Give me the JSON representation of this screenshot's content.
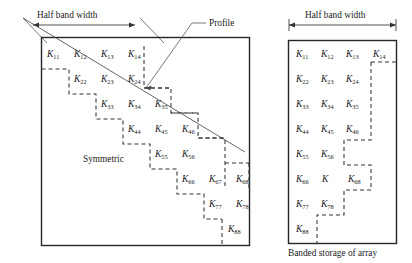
{
  "figure": {
    "title_caption": "Banded storage of array",
    "annotations": {
      "half_band_width_left": "Half band width",
      "half_band_width_right": "Half band width",
      "profile": "Profile",
      "symmetric": "Symmetric"
    }
  },
  "full_matrix": {
    "name": "full-symmetric-matrix",
    "rows": [
      {
        "row_index": 1,
        "cells": [
          {
            "base": "K",
            "sub": "11"
          },
          {
            "base": "K",
            "sub": "12"
          },
          {
            "base": "K",
            "sub": "13"
          },
          {
            "base": "K",
            "sub": "14"
          }
        ]
      },
      {
        "row_index": 2,
        "cells": [
          {
            "base": "K",
            "sub": "22"
          },
          {
            "base": "K",
            "sub": "23"
          },
          {
            "base": "K",
            "sub": "24"
          }
        ]
      },
      {
        "row_index": 3,
        "cells": [
          {
            "base": "K",
            "sub": "33"
          },
          {
            "base": "K",
            "sub": "34"
          },
          {
            "base": "K",
            "sub": "35"
          }
        ]
      },
      {
        "row_index": 4,
        "cells": [
          {
            "base": "K",
            "sub": "44"
          },
          {
            "base": "K",
            "sub": "45"
          },
          {
            "base": "K",
            "sub": "46"
          }
        ]
      },
      {
        "row_index": 5,
        "cells": [
          {
            "base": "K",
            "sub": "55"
          },
          {
            "base": "K",
            "sub": "56"
          }
        ]
      },
      {
        "row_index": 6,
        "cells": [
          {
            "base": "K",
            "sub": "66"
          },
          {
            "base": "K",
            "sub": "67"
          },
          {
            "base": "K",
            "sub": "68"
          }
        ]
      },
      {
        "row_index": 7,
        "cells": [
          {
            "base": "K",
            "sub": "77"
          },
          {
            "base": "K",
            "sub": "78"
          }
        ]
      },
      {
        "row_index": 8,
        "cells": [
          {
            "base": "K",
            "sub": "88"
          }
        ]
      }
    ]
  },
  "banded_matrix": {
    "name": "banded-storage-matrix",
    "caption": "Banded storage of array",
    "rows": [
      {
        "row_index": 1,
        "cells": [
          {
            "base": "K",
            "sub": "11"
          },
          {
            "base": "K",
            "sub": "12"
          },
          {
            "base": "K",
            "sub": "13"
          },
          {
            "base": "K",
            "sub": "14"
          }
        ]
      },
      {
        "row_index": 2,
        "cells": [
          {
            "base": "K",
            "sub": "22"
          },
          {
            "base": "K",
            "sub": "23"
          },
          {
            "base": "K",
            "sub": "24"
          }
        ]
      },
      {
        "row_index": 3,
        "cells": [
          {
            "base": "K",
            "sub": "33"
          },
          {
            "base": "K",
            "sub": "34"
          },
          {
            "base": "K",
            "sub": "35"
          }
        ]
      },
      {
        "row_index": 4,
        "cells": [
          {
            "base": "K",
            "sub": "44"
          },
          {
            "base": "K",
            "sub": "45"
          },
          {
            "base": "K",
            "sub": "46"
          }
        ]
      },
      {
        "row_index": 5,
        "cells": [
          {
            "base": "K",
            "sub": "55"
          },
          {
            "base": "K",
            "sub": "56"
          }
        ]
      },
      {
        "row_index": 6,
        "cells": [
          {
            "base": "K",
            "sub": "66"
          },
          {
            "base": "K",
            "sub": ""
          },
          {
            "base": "K",
            "sub": "68"
          }
        ]
      },
      {
        "row_index": 7,
        "cells": [
          {
            "base": "K",
            "sub": "77"
          },
          {
            "base": "K",
            "sub": "78"
          }
        ]
      },
      {
        "row_index": 8,
        "cells": [
          {
            "base": "K",
            "sub": "88"
          }
        ]
      }
    ]
  },
  "colors": {
    "ink": "#1a1a1a",
    "box_stroke": "#262626",
    "dashed_stroke": "#333333",
    "thin_line": "#4a4a4a",
    "background": "#ffffff"
  }
}
